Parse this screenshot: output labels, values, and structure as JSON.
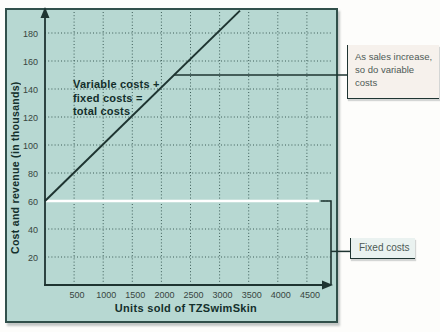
{
  "chart_data": {
    "type": "line",
    "title": "",
    "xlabel": "Units sold of TZSwimSkin",
    "ylabel": "Cost and revenue (in thousands)",
    "x_ticks": [
      500,
      1000,
      1500,
      2000,
      2500,
      3000,
      3500,
      4000,
      4500
    ],
    "y_ticks": [
      20,
      40,
      60,
      80,
      100,
      120,
      140,
      160,
      180
    ],
    "xlim": [
      0,
      4800
    ],
    "ylim": [
      0,
      196
    ],
    "grid": true,
    "series": [
      {
        "name": "Total costs (variable costs + fixed costs)",
        "points": [
          [
            0,
            60
          ],
          [
            3350,
            196
          ]
        ],
        "color": "#1e3431"
      }
    ],
    "fixed_costs_line": {
      "y": 60,
      "x_start": 0,
      "color": "#ffffff"
    },
    "in_chart_label": "Variable costs +\nfixed costs =\ntotal costs",
    "callouts": [
      {
        "id": "variable",
        "text": "As sales increase,\nso do variable\ncosts",
        "attach_y": 150
      },
      {
        "id": "fixed",
        "text": "Fixed costs",
        "attach_y": 24,
        "bracket_from": 60,
        "bracket_to": 0
      }
    ]
  },
  "colors": {
    "panel_bg": "#b7d8d2",
    "panel_border": "#31504b",
    "grid": "#3c5c57",
    "line": "#1e3431",
    "tick_text": "#37453f",
    "title_text": "#14302c",
    "callout_text": "#4e5a56",
    "callout_variable_bg": "#f6f1ec",
    "callout_fixed_bg": "#eaf2f0",
    "fixed_line": "#ffffff"
  }
}
